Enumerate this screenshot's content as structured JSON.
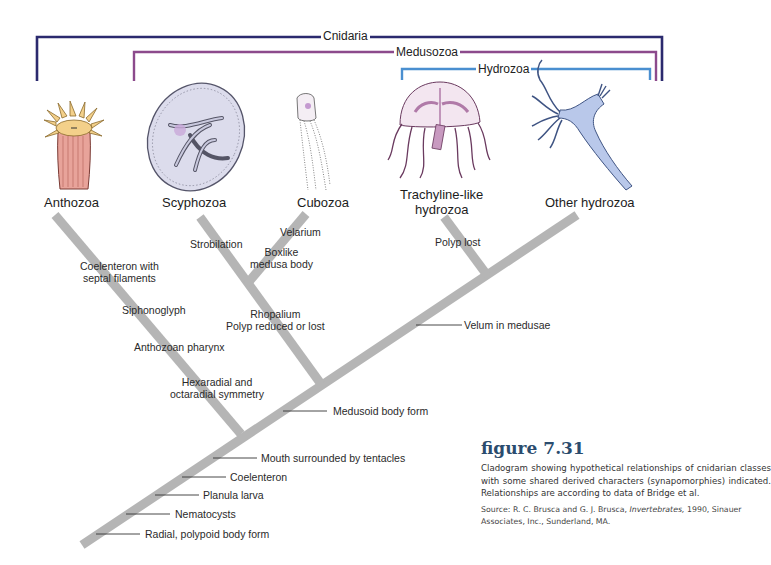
{
  "clades": {
    "cnidaria": {
      "label": "Cnidaria",
      "color": "#2b2a6e"
    },
    "medusozoa": {
      "label": "Medusozoa",
      "color": "#8c4a8c"
    },
    "hydrozoa": {
      "label": "Hydrozoa",
      "color": "#4a8fd0"
    }
  },
  "taxa": [
    {
      "id": "anthozoa",
      "label": "Anthozoa",
      "illustration": "sea-anemone"
    },
    {
      "id": "scyphozoa",
      "label": "Scyphozoa",
      "illustration": "jellyfish"
    },
    {
      "id": "cubozoa",
      "label": "Cubozoa",
      "illustration": "box-jellyfish"
    },
    {
      "id": "trachyline",
      "label": "Trachyline-like\nhydrozoa",
      "line1": "Trachyline-like",
      "line2": "hydrozoa",
      "illustration": "hydromedusa"
    },
    {
      "id": "other-hydrozoa",
      "label": "Other hydrozoa",
      "illustration": "hydroid-polyp"
    }
  ],
  "branch_characters": {
    "anthozoa": [
      "Coelenteron with",
      "septal filaments",
      "Siphonoglyph",
      "Anthozoan pharynx",
      "Hexaradial and",
      "octaradial symmetry"
    ],
    "scyphozoa": [
      "Strobilation",
      "Rhopalium",
      "Polyp reduced or lost"
    ],
    "cubozoa": [
      "Velarium",
      "Boxlike",
      "medusa body"
    ],
    "trachyline": [
      "Polyp lost"
    ]
  },
  "trunk_characters": [
    "Velum in medusae",
    "Medusoid body form",
    "Mouth surrounded by tentacles",
    "Coelenteron",
    "Planula larva",
    "Nematocysts",
    "Radial, polypoid body form"
  ],
  "caption": {
    "title": "figure 7.31",
    "text": "Cladogram showing hypothetical relationships of cnidarian classes with some shared derived characters (synapomorphies) indicated. Relationships are according to data of Bridge et al.",
    "source_prefix": "Source: R. C. Brusca and G. J. Brusca, ",
    "source_title": "Invertebrates,",
    "source_suffix": " 1990, Sinauer Associates, Inc., Sunderland, MA."
  },
  "colors": {
    "branch": "#b5b5b5",
    "caption_title": "#2b4c6e"
  }
}
